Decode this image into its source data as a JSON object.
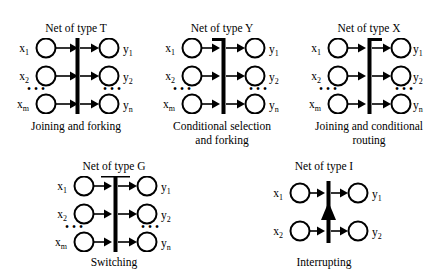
{
  "figure": {
    "background_color": "#ffffff",
    "ink_color": "#000000",
    "nets": [
      {
        "id": "T",
        "title": "Net of type T",
        "caption_lines": [
          "Joining and forking"
        ],
        "bar_style": "plain-vertical-bar",
        "rows": [
          {
            "input_label": "x",
            "input_sub": "1",
            "output_label": "y",
            "output_sub": "1"
          },
          {
            "input_label": "x",
            "input_sub": "2",
            "output_label": "y",
            "output_sub": "2"
          },
          {
            "input_label": "x",
            "input_sub": "m",
            "output_label": "y",
            "output_sub": "n"
          }
        ],
        "ellipsis": "• • •",
        "input_arrowheads": true,
        "output_arrowheads": true,
        "center_arrow_up": false
      },
      {
        "id": "Y",
        "title": "Net of type Y",
        "caption_lines": [
          "Conditional selection",
          "and forking"
        ],
        "bar_style": "top-nub-left",
        "rows": [
          {
            "input_label": "x",
            "input_sub": "1",
            "output_label": "y",
            "output_sub": "1"
          },
          {
            "input_label": "x",
            "input_sub": "2",
            "output_label": "y",
            "output_sub": "2"
          },
          {
            "input_label": "x",
            "input_sub": "m",
            "output_label": "y",
            "output_sub": "n"
          }
        ],
        "ellipsis": "• • •",
        "input_arrowheads": true,
        "output_arrowheads": true,
        "center_arrow_up": false
      },
      {
        "id": "X",
        "title": "Net of type X",
        "caption_lines": [
          "Joining and conditional",
          "routing"
        ],
        "bar_style": "top-nub-right",
        "rows": [
          {
            "input_label": "x",
            "input_sub": "1",
            "output_label": "y",
            "output_sub": "1"
          },
          {
            "input_label": "x",
            "input_sub": "2",
            "output_label": "y",
            "output_sub": "2"
          },
          {
            "input_label": "x",
            "input_sub": "m",
            "output_label": "y",
            "output_sub": "n"
          }
        ],
        "ellipsis": "• • •",
        "input_arrowheads": true,
        "output_arrowheads": true,
        "center_arrow_up": false
      },
      {
        "id": "G",
        "title": "Net of type G",
        "caption_lines": [
          "Switching"
        ],
        "bar_style": "top-crossbar",
        "rows": [
          {
            "input_label": "x",
            "input_sub": "1",
            "output_label": "y",
            "output_sub": "1"
          },
          {
            "input_label": "x",
            "input_sub": "2",
            "output_label": "y",
            "output_sub": "2"
          },
          {
            "input_label": "x",
            "input_sub": "m",
            "output_label": "y",
            "output_sub": "n"
          }
        ],
        "ellipsis": "• • •",
        "input_arrowheads": true,
        "output_arrowheads": true,
        "center_arrow_up": false
      },
      {
        "id": "I",
        "title": "Net of type I",
        "caption_lines": [
          "Interrupting"
        ],
        "bar_style": "plain-vertical-bar",
        "rows": [
          {
            "input_label": "x",
            "input_sub": "1",
            "output_label": "y",
            "output_sub": "1"
          },
          {
            "input_label": "x",
            "input_sub": "2",
            "output_label": "y",
            "output_sub": "2"
          }
        ],
        "ellipsis": "",
        "input_arrowheads": true,
        "output_arrowheads": true,
        "center_arrow_up": true
      }
    ]
  }
}
